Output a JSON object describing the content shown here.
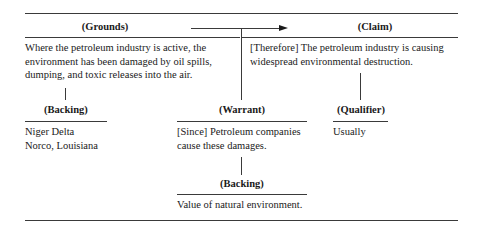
{
  "diagram": {
    "type": "Toulmin argument model",
    "grounds": {
      "heading": "(Grounds)",
      "text": "Where the petroleum industry is active, the environment has been damaged by oil spills, dumping, and toxic releases into the air."
    },
    "claim": {
      "heading": "(Claim)",
      "text": "[Therefore] The petroleum industry is causing widespread environmental destruction."
    },
    "backing_grounds": {
      "heading": "(Backing)",
      "lines": [
        "Niger Delta",
        "Norco, Louisiana"
      ]
    },
    "warrant": {
      "heading": "(Warrant)",
      "text": "[Since] Petroleum companies cause these damages."
    },
    "qualifier": {
      "heading": "(Qualifier)",
      "text": "Usually"
    },
    "backing_warrant": {
      "heading": "(Backing)",
      "text": "Value of natural environment."
    },
    "connections": [
      {
        "from": "grounds",
        "to": "claim",
        "kind": "arrow"
      },
      {
        "from": "grounds",
        "to": "backing_grounds",
        "kind": "line"
      },
      {
        "from": "grounds-claim-arrow",
        "to": "warrant",
        "kind": "line"
      },
      {
        "from": "claim",
        "to": "qualifier",
        "kind": "line"
      },
      {
        "from": "warrant",
        "to": "backing_warrant",
        "kind": "line"
      }
    ]
  }
}
